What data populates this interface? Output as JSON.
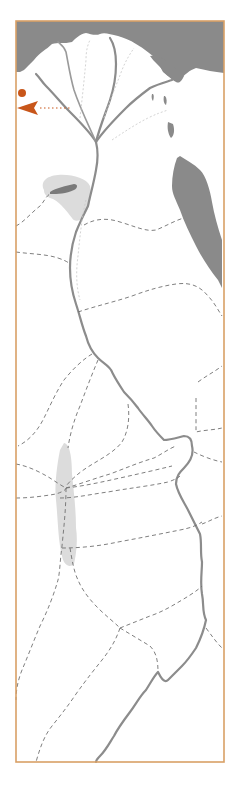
{
  "map": {
    "title": "",
    "colors": {
      "frame": "#d9a066",
      "sea": "#8a8a8a",
      "oasis": "#dcdcdc",
      "river": "#8c8c8c",
      "route": "#707070",
      "marker": "#c8561a"
    },
    "features": {
      "sea_north": "mediterranean-sea",
      "gulf": "red-sea-gulf",
      "river": "nile-river",
      "delta": "nile-delta-branches",
      "oasis_north": "faiyum-oasis",
      "oasis_south": "western-desert-oasis",
      "routes": "desert-caravan-routes"
    },
    "marker": {
      "dot": "location-dot",
      "arrow": "direction-arrow-left"
    }
  }
}
